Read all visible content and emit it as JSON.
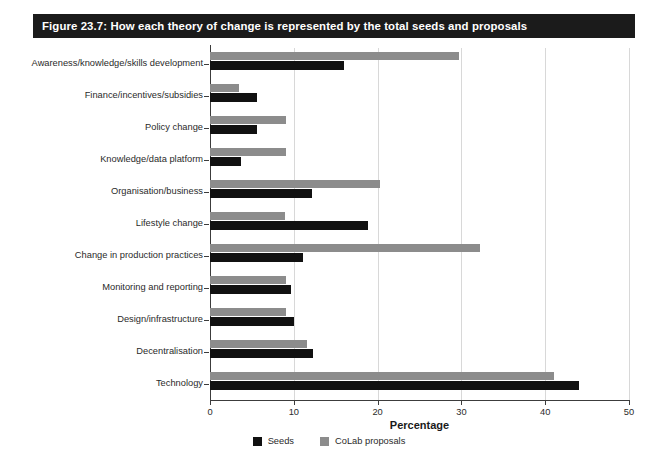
{
  "figure": {
    "title": "Figure 23.7: How each theory of change is represented by the total seeds and proposals",
    "title_bar_color": "#1b1b1b",
    "title_text_color": "#ffffff"
  },
  "chart_data": {
    "type": "bar",
    "orientation": "horizontal",
    "title": "Figure 23.7: How each theory of change is represented by the total seeds and proposals",
    "xlabel": "Percentage",
    "ylabel": "",
    "xlim": [
      0,
      50
    ],
    "xticks": [
      0,
      10,
      20,
      30,
      40,
      50
    ],
    "xtick_labels": [
      "0",
      "10",
      "20",
      "30",
      "40",
      "50"
    ],
    "grid": "vertical",
    "legend_position": "bottom-center",
    "categories": [
      "Awareness/knowledge/skills development",
      "Finance/incentives/subsidies",
      "Policy change",
      "Knowledge/data platform",
      "Organisation/business",
      "Lifestyle change",
      "Change in production practices",
      "Monitoring and reporting",
      "Design/infrastructure",
      "Decentralisation",
      "Technology"
    ],
    "series": [
      {
        "name": "Seeds",
        "color": "#111111",
        "values": [
          16.0,
          5.6,
          5.6,
          3.7,
          12.2,
          18.9,
          11.1,
          9.7,
          10.0,
          12.3,
          44.0
        ]
      },
      {
        "name": "CoLab proposals",
        "color": "#8c8c8c",
        "values": [
          29.7,
          3.5,
          9.1,
          9.1,
          20.3,
          9.0,
          32.2,
          9.1,
          9.1,
          11.6,
          41.1
        ]
      }
    ]
  },
  "legend": {
    "items": [
      {
        "label": "Seeds",
        "color": "#111111"
      },
      {
        "label": "CoLab proposals",
        "color": "#8c8c8c"
      }
    ]
  }
}
